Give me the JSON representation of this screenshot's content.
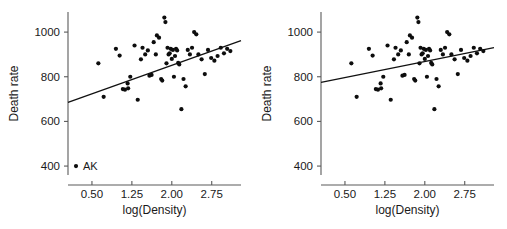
{
  "figure": {
    "background": "#ffffff",
    "point_color": "#0d0d0d",
    "line_color": "#111111",
    "axis_color": "#5a5a5a"
  },
  "chart_data": [
    {
      "type": "scatter",
      "panel": "left",
      "title": "",
      "xlabel": "log(Density)",
      "ylabel": "Death rate",
      "xticks": [
        "0.50",
        "1.25",
        "2.00",
        "2.75"
      ],
      "xtick_values": [
        0.5,
        1.25,
        2.0,
        2.75
      ],
      "yticks": [
        "400",
        "600",
        "800",
        "1000"
      ],
      "ytick_values": [
        400,
        600,
        800,
        1000
      ],
      "xlim": [
        0.05,
        3.3
      ],
      "ylim": [
        360,
        1090
      ],
      "grid": false,
      "legend": null,
      "annotations": [
        {
          "text": "AK",
          "x": 0.2,
          "y": 400,
          "note": "outlier point label"
        }
      ],
      "trendline": {
        "type": "linear-fit",
        "x": [
          0.05,
          3.3
        ],
        "y": [
          685,
          962
        ],
        "slope": 85.2,
        "intercept": 680.7,
        "includes_outlier": true
      },
      "x": [
        0.2,
        0.62,
        0.72,
        0.95,
        1.02,
        1.08,
        1.12,
        1.17,
        1.18,
        1.22,
        1.3,
        1.36,
        1.42,
        1.45,
        1.5,
        1.55,
        1.58,
        1.62,
        1.66,
        1.7,
        1.72,
        1.76,
        1.8,
        1.82,
        1.86,
        1.88,
        1.9,
        1.92,
        1.94,
        1.96,
        1.98,
        2.0,
        2.02,
        2.04,
        2.06,
        2.08,
        2.1,
        2.12,
        2.14,
        2.18,
        2.22,
        2.26,
        2.3,
        2.34,
        2.38,
        2.42,
        2.46,
        2.5,
        2.56,
        2.62,
        2.68,
        2.74,
        2.8,
        2.86,
        2.92,
        2.98,
        3.04,
        3.1
      ],
      "y": [
        400,
        860,
        710,
        925,
        895,
        745,
        742,
        770,
        748,
        800,
        940,
        697,
        878,
        930,
        900,
        918,
        805,
        808,
        955,
        900,
        985,
        975,
        790,
        783,
        1065,
        1045,
        860,
        930,
        900,
        905,
        925,
        880,
        920,
        800,
        893,
        925,
        918,
        862,
        855,
        655,
        790,
        757,
        920,
        900,
        930,
        1000,
        990,
        900,
        878,
        812,
        920,
        884,
        872,
        893,
        930,
        905,
        925,
        915
      ]
    },
    {
      "type": "scatter",
      "panel": "right",
      "title": "",
      "xlabel": "log(Density)",
      "ylabel": "Death rate",
      "xticks": [
        "0.50",
        "1.25",
        "2.00",
        "2.75"
      ],
      "xtick_values": [
        0.5,
        1.25,
        2.0,
        2.75
      ],
      "yticks": [
        "400",
        "600",
        "800",
        "1000"
      ],
      "ytick_values": [
        400,
        600,
        800,
        1000
      ],
      "xlim": [
        0.05,
        3.3
      ],
      "ylim": [
        360,
        1090
      ],
      "grid": false,
      "legend": null,
      "annotations": [],
      "trendline": {
        "type": "linear-fit",
        "x": [
          0.05,
          3.3
        ],
        "y": [
          775,
          930
        ],
        "slope": 47.7,
        "intercept": 772.6,
        "includes_outlier": false
      },
      "x": [
        0.62,
        0.72,
        0.95,
        1.02,
        1.08,
        1.12,
        1.17,
        1.18,
        1.22,
        1.3,
        1.36,
        1.42,
        1.45,
        1.5,
        1.55,
        1.58,
        1.62,
        1.66,
        1.7,
        1.72,
        1.76,
        1.8,
        1.82,
        1.86,
        1.88,
        1.9,
        1.92,
        1.94,
        1.96,
        1.98,
        2.0,
        2.02,
        2.04,
        2.06,
        2.08,
        2.1,
        2.12,
        2.14,
        2.18,
        2.22,
        2.26,
        2.3,
        2.34,
        2.38,
        2.42,
        2.46,
        2.5,
        2.56,
        2.62,
        2.68,
        2.74,
        2.8,
        2.86,
        2.92,
        2.98,
        3.04,
        3.1
      ],
      "y": [
        860,
        710,
        925,
        895,
        745,
        742,
        770,
        748,
        800,
        940,
        697,
        878,
        930,
        900,
        918,
        805,
        808,
        955,
        900,
        985,
        975,
        790,
        783,
        1065,
        1045,
        860,
        930,
        900,
        905,
        925,
        880,
        920,
        800,
        893,
        925,
        918,
        862,
        855,
        655,
        790,
        757,
        920,
        900,
        930,
        1000,
        990,
        900,
        878,
        812,
        920,
        884,
        872,
        893,
        930,
        905,
        925,
        915
      ]
    }
  ]
}
